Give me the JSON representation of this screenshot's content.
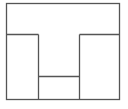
{
  "diagram": {
    "width": 128,
    "height": 109,
    "stroke_color": "#555555",
    "background": "#ffffff",
    "outer_rect": {
      "x1": 6,
      "y1": 3,
      "x2": 119,
      "y2": 99
    },
    "segments": [
      {
        "name": "left-shelf-line",
        "x1": 6,
        "y1": 34,
        "x2": 38,
        "y2": 34
      },
      {
        "name": "right-shelf-line",
        "x1": 79,
        "y1": 34,
        "x2": 119,
        "y2": 34
      },
      {
        "name": "left-inner-wall",
        "x1": 38,
        "y1": 34,
        "x2": 38,
        "y2": 99
      },
      {
        "name": "right-inner-wall",
        "x1": 79,
        "y1": 34,
        "x2": 79,
        "y2": 99
      },
      {
        "name": "center-bottom-divider",
        "x1": 38,
        "y1": 76,
        "x2": 79,
        "y2": 76
      }
    ],
    "regions": [
      {
        "name": "top-t-region"
      },
      {
        "name": "left-block"
      },
      {
        "name": "right-block"
      },
      {
        "name": "center-bottom-block"
      }
    ]
  }
}
